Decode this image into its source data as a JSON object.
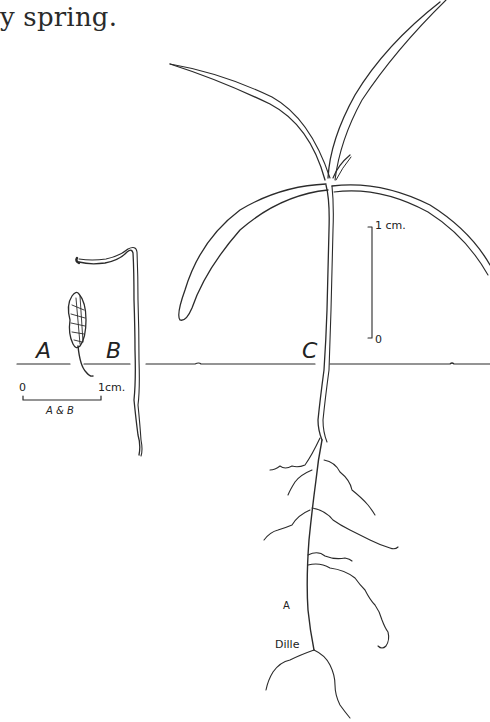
{
  "caption": {
    "text": "y spring."
  },
  "figure": {
    "panels": [
      {
        "id": "A",
        "label": "A"
      },
      {
        "id": "B",
        "label": "B"
      },
      {
        "id": "C",
        "label": "C"
      }
    ],
    "scale_bar_ab": {
      "start": "0",
      "end": "1cm.",
      "applies_to": "A & B"
    },
    "scale_bar_c": {
      "top": "1 cm.",
      "bottom": "0"
    },
    "annotations": {
      "root_mark": "A",
      "signature": "Dille"
    },
    "colors": {
      "ink": "#2b2b2b",
      "background": "#ffffff"
    }
  }
}
